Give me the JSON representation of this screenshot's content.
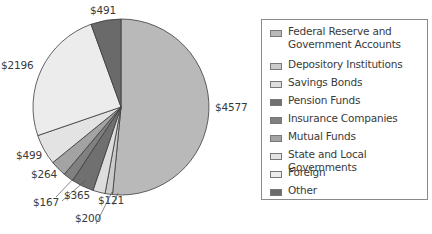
{
  "chart_data": {
    "type": "pie",
    "title": "",
    "categories": [
      "Federal Reserve and Government Accounts",
      "Depository Institutions",
      "Savings Bonds",
      "Pension Funds",
      "Insurance Companies",
      "Mutual Funds",
      "State and Local Governments",
      "Foreign",
      "Other"
    ],
    "values": [
      4577,
      121,
      200,
      365,
      167,
      264,
      499,
      2196,
      491
    ],
    "value_labels": [
      "$4577",
      "$121",
      "$200",
      "$365",
      "$167",
      "$264",
      "$499",
      "$2196",
      "$491"
    ],
    "colors": [
      "#b9b9b9",
      "#cbcbcb",
      "#dddddd",
      "#707070",
      "#808080",
      "#a3a3a3",
      "#e3e3e3",
      "#ececec",
      "#6a6a6a"
    ],
    "start_angle_deg": 0,
    "direction": "clockwise",
    "legend_position": "right"
  },
  "legend": {
    "items": [
      {
        "label_line1": "Federal Reserve and",
        "label_line2": "Government Accounts"
      },
      {
        "label_line1": "Depository Institutions",
        "label_line2": ""
      },
      {
        "label_line1": "Savings Bonds",
        "label_line2": ""
      },
      {
        "label_line1": "Pension Funds",
        "label_line2": ""
      },
      {
        "label_line1": "Insurance Companies",
        "label_line2": ""
      },
      {
        "label_line1": "Mutual Funds",
        "label_line2": ""
      },
      {
        "label_line1": "State and Local Governments",
        "label_line2": ""
      },
      {
        "label_line1": "Foreign",
        "label_line2": ""
      },
      {
        "label_line1": "Other",
        "label_line2": ""
      }
    ]
  }
}
